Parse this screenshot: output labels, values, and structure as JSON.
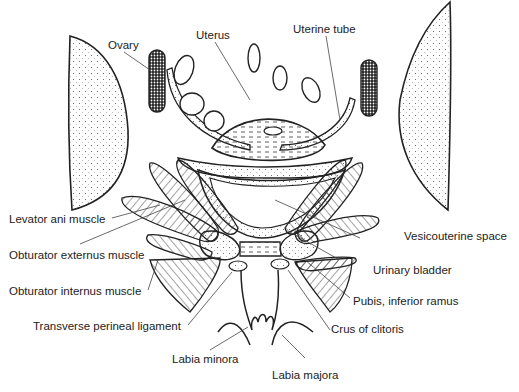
{
  "figure": {
    "labels": {
      "ovary": "Ovary",
      "uterus": "Uterus",
      "uterine_tube": "Uterine tube",
      "levator_ani": "Levator ani muscle",
      "obturator_externus": "Obturator externus muscle",
      "obturator_internus": "Obturator internus muscle",
      "vesicouterine_space": "Vesicouterine space",
      "urinary_bladder": "Urinary bladder",
      "pubis_inferior_ramus": "Pubis, inferior ramus",
      "transverse_perineal_ligament": "Transverse perineal ligament",
      "crus_of_clitoris": "Crus of clitoris",
      "labia_minora": "Labia minora",
      "labia_majora": "Labia majora"
    },
    "colors": {
      "ink": "#222222",
      "background": "#ffffff"
    }
  }
}
